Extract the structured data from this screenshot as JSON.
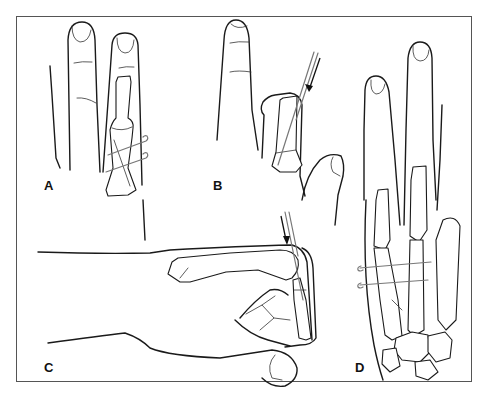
{
  "figure": {
    "panels": [
      {
        "id": "A",
        "label": "A",
        "content": "Two fingers; proximal phalanx with oblique fracture fixed by two transverse K-wires"
      },
      {
        "id": "B",
        "label": "B",
        "content": "Flexed finger with proximal phalanx; arrow indicating longitudinal K-wire insertion"
      },
      {
        "id": "C",
        "label": "C",
        "content": "Lateral view of hand with finger flexed; arrow indicating K-wire insertion through metacarpal head"
      },
      {
        "id": "D",
        "label": "D",
        "content": "Dorsal view of hand skeleton with metacarpal fracture fixed by two transverse K-wires"
      }
    ]
  },
  "colors": {
    "line": "#1a1a1a",
    "wire": "#777777",
    "frame": "#555555",
    "background": "#ffffff"
  }
}
